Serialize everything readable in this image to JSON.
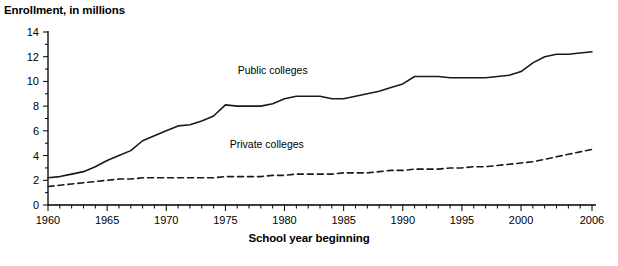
{
  "chart_data": {
    "type": "line",
    "title": "Enrollment, in millions",
    "subtitle": "",
    "xlabel": "School year beginning",
    "ylabel": "Enrollment, in millions",
    "xlim": [
      1960,
      2006
    ],
    "ylim": [
      0,
      14
    ],
    "grid": false,
    "legend_position": "inline-annotations",
    "y_ticks": [
      0,
      2,
      4,
      6,
      8,
      10,
      12,
      14
    ],
    "y_tick_labels": [
      "0",
      "2",
      "4",
      "6",
      "8",
      "10",
      "12",
      "14"
    ],
    "y_minor_tick_step": 1,
    "x_ticks": [
      1960,
      1965,
      1970,
      1975,
      1980,
      1985,
      1990,
      1995,
      2000,
      2006
    ],
    "x_tick_labels": [
      "1960",
      "1965",
      "1970",
      "1975",
      "1980",
      "1985",
      "1990",
      "1995",
      "2000",
      "2006"
    ],
    "x_minor_tick_step": 1,
    "x": [
      1960,
      1961,
      1962,
      1963,
      1964,
      1965,
      1966,
      1967,
      1968,
      1969,
      1970,
      1971,
      1972,
      1973,
      1974,
      1975,
      1976,
      1977,
      1978,
      1979,
      1980,
      1981,
      1982,
      1983,
      1984,
      1985,
      1986,
      1987,
      1988,
      1989,
      1990,
      1991,
      1992,
      1993,
      1994,
      1995,
      1996,
      1997,
      1998,
      1999,
      2000,
      2001,
      2002,
      2003,
      2004,
      2005,
      2006
    ],
    "series": [
      {
        "name": "Public colleges",
        "style": "solid",
        "color": "#1a1a1a",
        "label_x": 1979,
        "label_y": 10.6,
        "values": [
          2.2,
          2.3,
          2.5,
          2.7,
          3.1,
          3.6,
          4.0,
          4.4,
          5.2,
          5.6,
          6.0,
          6.4,
          6.5,
          6.8,
          7.2,
          8.1,
          8.0,
          8.0,
          8.0,
          8.2,
          8.6,
          8.8,
          8.8,
          8.8,
          8.6,
          8.6,
          8.8,
          9.0,
          9.2,
          9.5,
          9.8,
          10.4,
          10.4,
          10.4,
          10.3,
          10.3,
          10.3,
          10.3,
          10.4,
          10.5,
          10.8,
          11.5,
          12.0,
          12.2,
          12.2,
          12.3,
          12.4
        ]
      },
      {
        "name": "Private colleges",
        "style": "dashed",
        "color": "#1a1a1a",
        "label_x": 1978.5,
        "label_y": 4.6,
        "values": [
          1.5,
          1.6,
          1.7,
          1.8,
          1.9,
          2.0,
          2.1,
          2.1,
          2.2,
          2.2,
          2.2,
          2.2,
          2.2,
          2.2,
          2.2,
          2.3,
          2.3,
          2.3,
          2.3,
          2.4,
          2.4,
          2.5,
          2.5,
          2.5,
          2.5,
          2.6,
          2.6,
          2.6,
          2.7,
          2.8,
          2.8,
          2.9,
          2.9,
          2.9,
          3.0,
          3.0,
          3.1,
          3.1,
          3.2,
          3.3,
          3.4,
          3.5,
          3.7,
          3.9,
          4.1,
          4.3,
          4.5
        ]
      }
    ],
    "annotations": [
      {
        "text": "Public colleges",
        "x": 1979,
        "y": 10.6
      },
      {
        "text": "Private colleges",
        "x": 1978.5,
        "y": 4.6
      }
    ]
  }
}
